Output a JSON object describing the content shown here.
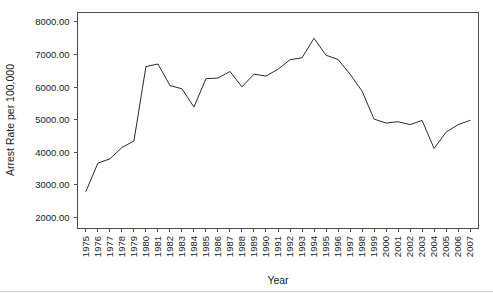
{
  "chart_data": {
    "type": "line",
    "title": "",
    "xlabel": "Year",
    "ylabel": "Arrest Rate per 100,000",
    "grid": false,
    "legend": false,
    "legend_position": "none",
    "line_color": "#2b2b2b",
    "axis_color": "#4d4d4d",
    "background_color": "#ffffff",
    "xlim": [
      1974.3,
      2007.7
    ],
    "ylim": [
      1680,
      8290
    ],
    "ytick_labels": [
      "2000.00",
      "3000.00",
      "4000.00",
      "5000.00",
      "6000.00",
      "7000.00",
      "8000.00"
    ],
    "ytick_values": [
      2000,
      3000,
      4000,
      5000,
      6000,
      7000,
      8000
    ],
    "categories": [
      "1975",
      "1976",
      "1977",
      "1978",
      "1979",
      "1980",
      "1981",
      "1982",
      "1983",
      "1984",
      "1985",
      "1986",
      "1987",
      "1988",
      "1989",
      "1990",
      "1991",
      "1992",
      "1993",
      "1994",
      "1995",
      "1996",
      "1997",
      "1998",
      "1999",
      "2000",
      "2001",
      "2002",
      "2003",
      "2004",
      "2005",
      "2006",
      "2007"
    ],
    "x": [
      1975,
      1976,
      1977,
      1978,
      1979,
      1980,
      1981,
      1982,
      1983,
      1984,
      1985,
      1986,
      1987,
      1988,
      1989,
      1990,
      1991,
      1992,
      1993,
      1994,
      1995,
      1996,
      1997,
      1998,
      1999,
      2000,
      2001,
      2002,
      2003,
      2004,
      2005,
      2006,
      2007
    ],
    "values": [
      2800,
      3670,
      3800,
      4150,
      4350,
      6630,
      6710,
      6050,
      5950,
      5390,
      6260,
      6280,
      6480,
      6010,
      6400,
      6340,
      6550,
      6840,
      6900,
      7500,
      6980,
      6850,
      6400,
      5880,
      5020,
      4900,
      4940,
      4850,
      4980,
      4120,
      4620,
      4850,
      4980
    ],
    "series_name": "Arrest Rate"
  }
}
